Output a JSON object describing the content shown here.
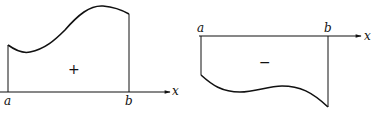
{
  "diagrams": [
    {
      "id": "positive-area",
      "axis_label": "x",
      "left_bound": "a",
      "right_bound": "b",
      "sign": "+"
    },
    {
      "id": "negative-area",
      "axis_label": "x",
      "left_bound": "a",
      "right_bound": "b",
      "sign": "−"
    }
  ],
  "colors": {
    "stroke": "#111111",
    "background": "#ffffff"
  }
}
